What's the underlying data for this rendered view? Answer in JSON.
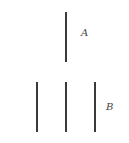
{
  "figure": {
    "group_a": {
      "label": "A",
      "lines": [
        {
          "x": 66,
          "y1": 12,
          "y2": 62
        }
      ]
    },
    "group_b": {
      "label": "B",
      "lines": [
        {
          "x": 37,
          "y1": 82,
          "y2": 132
        },
        {
          "x": 66,
          "y1": 82,
          "y2": 132
        },
        {
          "x": 95,
          "y1": 82,
          "y2": 132
        }
      ]
    },
    "line_color": "#3a3a3a"
  }
}
